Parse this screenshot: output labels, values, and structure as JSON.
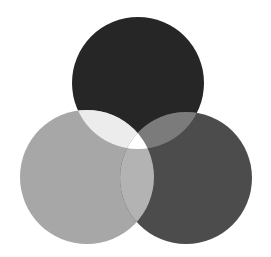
{
  "diagram": {
    "type": "venn-3",
    "background": "#ffffff",
    "circles": [
      {
        "id": "top",
        "cx": 138,
        "cy": 83,
        "r": 66,
        "fill": "#262626"
      },
      {
        "id": "left",
        "cx": 87,
        "cy": 177,
        "r": 67,
        "fill": "#a7a7a7"
      },
      {
        "id": "right",
        "cx": 186,
        "cy": 178,
        "r": 66,
        "fill": "#4c4c4c"
      }
    ],
    "overlaps": {
      "top_left": "#ececec",
      "top_right": "#7b7b7b",
      "left_right": "#b3b3b3",
      "all": "#ffffff"
    }
  }
}
